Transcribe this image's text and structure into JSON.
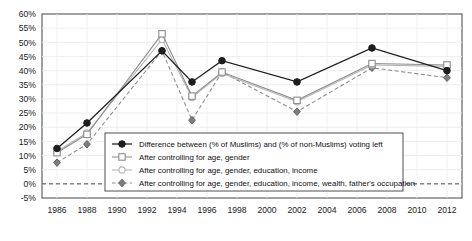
{
  "chart_data": {
    "type": "line",
    "title": "",
    "xlabel": "",
    "ylabel": "",
    "xlim": [
      1985,
      2013
    ],
    "ylim": [
      -5,
      60
    ],
    "ytick_step": 5,
    "grid": true,
    "legend_position": "inside-bottom-left",
    "zero_reference_line": true,
    "x": [
      1986,
      1988,
      1993,
      1995,
      1997,
      2002,
      2007,
      2012
    ],
    "xticks": [
      1986,
      1988,
      1990,
      1992,
      1994,
      1996,
      1998,
      2000,
      2002,
      2004,
      2006,
      2008,
      2010,
      2012
    ],
    "xtick_labels": [
      "1986",
      "1988",
      "1990",
      "1992",
      "1994",
      "1996",
      "1998",
      "2000",
      "2002",
      "2004",
      "2006",
      "2008",
      "2010",
      "2012"
    ],
    "yticks": [
      -5,
      0,
      5,
      10,
      15,
      20,
      25,
      30,
      35,
      40,
      45,
      50,
      55,
      60
    ],
    "ytick_labels": [
      "-5%",
      "0%",
      "5%",
      "10%",
      "15%",
      "20%",
      "25%",
      "30%",
      "35%",
      "40%",
      "45%",
      "50%",
      "55%",
      "60%"
    ],
    "series": [
      {
        "name": "Difference between (% of Muslims) and (% of non-Muslims) voting left",
        "marker": "filled-circle",
        "color": "#1d1d1d",
        "linestyle": "solid",
        "values": [
          12.5,
          21.5,
          47,
          36,
          43.5,
          36,
          48,
          40
        ]
      },
      {
        "name": "After controlling for age, gender",
        "marker": "open-square",
        "color": "#8d8d8d",
        "linestyle": "solid",
        "values": [
          11,
          17.5,
          53,
          31,
          39.5,
          29.5,
          42.5,
          42
        ]
      },
      {
        "name": "After controlling for age, gender, education, income",
        "marker": "open-circle",
        "color": "#b4b4b4",
        "linestyle": "solid",
        "values": [
          11.5,
          18,
          51,
          30.5,
          39,
          29,
          42,
          41.5
        ]
      },
      {
        "name": "After controlling for age, gender, education, income, wealth, father's occupation",
        "marker": "diamond",
        "color": "#8a8a8a",
        "linestyle": "dashed",
        "values": [
          7.5,
          14,
          47,
          22.5,
          39.5,
          25.5,
          41,
          37.5
        ]
      }
    ]
  }
}
